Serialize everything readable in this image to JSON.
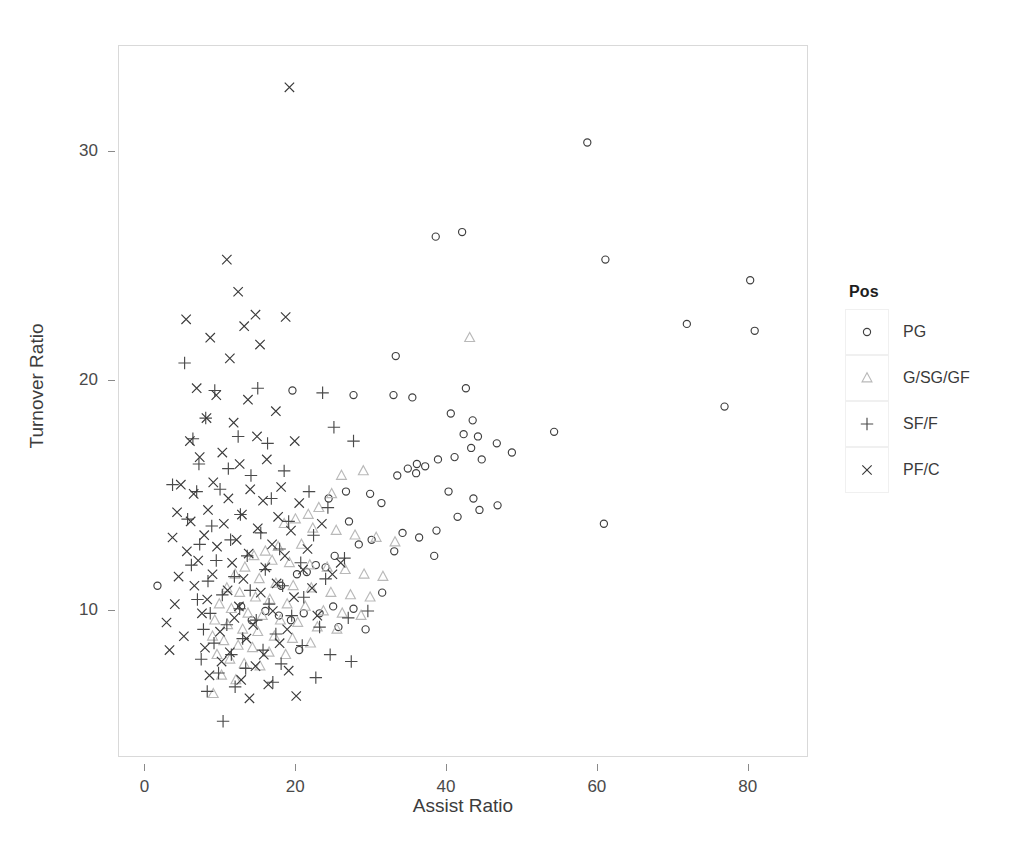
{
  "chart_data": {
    "type": "scatter",
    "title": "",
    "xlabel": "Assist Ratio",
    "ylabel": "Turnover Ratio",
    "xlim": [
      -3.5,
      88.0
    ],
    "ylim": [
      3.6,
      34.6
    ],
    "xticks": [
      0,
      20,
      40,
      60,
      80
    ],
    "xtick_labels": [
      "0",
      "20",
      "40",
      "60",
      "80"
    ],
    "yticks": [
      10,
      20,
      30
    ],
    "ytick_labels": [
      "10",
      "20",
      "30"
    ],
    "grid": false,
    "legend_title": "Pos",
    "legend_position": "right",
    "series": [
      {
        "name": "PG",
        "marker": "circle",
        "color": "#3f3f3f",
        "points": [
          [
            58.6,
            30.4
          ],
          [
            61.0,
            25.3
          ],
          [
            80.2,
            24.4
          ],
          [
            71.8,
            22.5
          ],
          [
            80.8,
            22.2
          ],
          [
            76.8,
            18.9
          ],
          [
            54.2,
            17.8
          ],
          [
            60.8,
            13.8
          ],
          [
            38.5,
            26.3
          ],
          [
            42.0,
            26.5
          ],
          [
            33.2,
            21.1
          ],
          [
            19.5,
            19.6
          ],
          [
            27.6,
            19.4
          ],
          [
            32.9,
            19.4
          ],
          [
            35.4,
            19.3
          ],
          [
            42.5,
            19.7
          ],
          [
            40.5,
            18.6
          ],
          [
            43.4,
            18.3
          ],
          [
            42.2,
            17.7
          ],
          [
            44.1,
            17.6
          ],
          [
            43.2,
            17.1
          ],
          [
            46.6,
            17.3
          ],
          [
            48.6,
            16.9
          ],
          [
            41.0,
            16.7
          ],
          [
            44.6,
            16.6
          ],
          [
            38.8,
            16.6
          ],
          [
            36.0,
            16.4
          ],
          [
            37.1,
            16.3
          ],
          [
            34.8,
            16.2
          ],
          [
            35.9,
            16.0
          ],
          [
            33.4,
            15.9
          ],
          [
            40.2,
            15.2
          ],
          [
            43.5,
            14.9
          ],
          [
            46.7,
            14.6
          ],
          [
            44.3,
            14.4
          ],
          [
            41.4,
            14.1
          ],
          [
            38.6,
            13.5
          ],
          [
            36.3,
            13.2
          ],
          [
            34.1,
            13.4
          ],
          [
            33.0,
            12.6
          ],
          [
            38.3,
            12.4
          ],
          [
            31.3,
            14.7
          ],
          [
            29.8,
            15.1
          ],
          [
            26.6,
            15.2
          ],
          [
            24.3,
            14.9
          ],
          [
            27.0,
            13.9
          ],
          [
            30.0,
            13.1
          ],
          [
            28.3,
            12.9
          ],
          [
            25.1,
            12.4
          ],
          [
            22.6,
            12.0
          ],
          [
            23.9,
            11.9
          ],
          [
            21.4,
            11.7
          ],
          [
            31.4,
            10.8
          ],
          [
            20.1,
            11.6
          ],
          [
            18.0,
            11.1
          ],
          [
            1.6,
            11.1
          ],
          [
            15.9,
            10.0
          ],
          [
            17.7,
            9.8
          ],
          [
            19.3,
            9.6
          ],
          [
            21.0,
            9.9
          ],
          [
            24.9,
            10.2
          ],
          [
            23.1,
            9.9
          ],
          [
            20.4,
            8.3
          ],
          [
            25.6,
            9.3
          ],
          [
            27.6,
            10.1
          ],
          [
            29.2,
            9.2
          ],
          [
            12.7,
            10.2
          ],
          [
            14.1,
            9.6
          ]
        ]
      },
      {
        "name": "G/SG/GF",
        "marker": "triangle",
        "color": "#b9b9b9",
        "points": [
          [
            43.0,
            21.9
          ],
          [
            28.9,
            16.1
          ],
          [
            26.0,
            15.9
          ],
          [
            24.7,
            15.1
          ],
          [
            23.0,
            14.5
          ],
          [
            21.6,
            14.2
          ],
          [
            19.9,
            14.0
          ],
          [
            18.4,
            13.8
          ],
          [
            22.2,
            13.6
          ],
          [
            25.3,
            13.5
          ],
          [
            27.8,
            13.3
          ],
          [
            30.6,
            13.2
          ],
          [
            33.1,
            13.0
          ],
          [
            20.7,
            12.9
          ],
          [
            17.6,
            12.8
          ],
          [
            15.9,
            12.6
          ],
          [
            14.4,
            12.4
          ],
          [
            16.8,
            12.2
          ],
          [
            19.1,
            12.1
          ],
          [
            21.8,
            12.0
          ],
          [
            24.1,
            11.9
          ],
          [
            26.5,
            11.8
          ],
          [
            29.0,
            11.6
          ],
          [
            31.5,
            11.5
          ],
          [
            13.2,
            11.9
          ],
          [
            11.9,
            11.6
          ],
          [
            15.1,
            11.4
          ],
          [
            17.3,
            11.2
          ],
          [
            19.6,
            11.1
          ],
          [
            22.0,
            11.0
          ],
          [
            24.6,
            10.8
          ],
          [
            27.2,
            10.7
          ],
          [
            29.8,
            10.6
          ],
          [
            10.8,
            11.0
          ],
          [
            12.5,
            10.8
          ],
          [
            14.6,
            10.6
          ],
          [
            16.5,
            10.5
          ],
          [
            18.8,
            10.3
          ],
          [
            21.2,
            10.2
          ],
          [
            23.6,
            10.0
          ],
          [
            26.1,
            9.9
          ],
          [
            28.6,
            9.8
          ],
          [
            9.8,
            10.3
          ],
          [
            11.4,
            10.1
          ],
          [
            13.6,
            9.9
          ],
          [
            15.5,
            9.8
          ],
          [
            17.9,
            9.6
          ],
          [
            20.2,
            9.5
          ],
          [
            22.8,
            9.3
          ],
          [
            25.4,
            9.2
          ],
          [
            9.2,
            9.6
          ],
          [
            10.9,
            9.4
          ],
          [
            12.9,
            9.2
          ],
          [
            14.9,
            9.1
          ],
          [
            17.1,
            8.9
          ],
          [
            19.5,
            8.8
          ],
          [
            21.9,
            8.6
          ],
          [
            8.9,
            8.9
          ],
          [
            10.4,
            8.7
          ],
          [
            12.3,
            8.5
          ],
          [
            14.2,
            8.4
          ],
          [
            16.4,
            8.2
          ],
          [
            18.6,
            8.1
          ],
          [
            9.5,
            8.1
          ],
          [
            11.2,
            7.9
          ],
          [
            13.1,
            7.7
          ],
          [
            15.2,
            7.6
          ],
          [
            10.1,
            7.2
          ],
          [
            12.0,
            7.0
          ],
          [
            9.0,
            6.4
          ]
        ]
      },
      {
        "name": "SF/F",
        "marker": "plus",
        "color": "#4a4a4a",
        "points": [
          [
            5.2,
            20.8
          ],
          [
            14.9,
            19.7
          ],
          [
            9.2,
            19.6
          ],
          [
            23.5,
            19.5
          ],
          [
            8.0,
            18.4
          ],
          [
            25.0,
            18.0
          ],
          [
            12.3,
            17.6
          ],
          [
            6.3,
            17.5
          ],
          [
            16.2,
            17.3
          ],
          [
            27.6,
            17.4
          ],
          [
            7.1,
            16.4
          ],
          [
            11.0,
            16.2
          ],
          [
            18.4,
            16.1
          ],
          [
            14.0,
            15.9
          ],
          [
            3.6,
            15.5
          ],
          [
            9.9,
            15.3
          ],
          [
            21.7,
            15.2
          ],
          [
            6.8,
            15.2
          ],
          [
            16.7,
            14.9
          ],
          [
            24.2,
            14.5
          ],
          [
            12.6,
            14.2
          ],
          [
            5.6,
            14.0
          ],
          [
            19.0,
            13.9
          ],
          [
            8.8,
            13.7
          ],
          [
            15.3,
            13.4
          ],
          [
            22.3,
            13.3
          ],
          [
            11.3,
            13.1
          ],
          [
            7.2,
            12.9
          ],
          [
            17.8,
            12.7
          ],
          [
            26.4,
            12.3
          ],
          [
            13.5,
            12.4
          ],
          [
            9.4,
            12.2
          ],
          [
            20.6,
            12.1
          ],
          [
            6.1,
            12.0
          ],
          [
            15.9,
            11.8
          ],
          [
            11.8,
            11.5
          ],
          [
            23.9,
            11.4
          ],
          [
            8.3,
            11.3
          ],
          [
            18.2,
            11.1
          ],
          [
            13.9,
            10.9
          ],
          [
            10.2,
            10.7
          ],
          [
            21.0,
            10.6
          ],
          [
            6.9,
            10.5
          ],
          [
            16.4,
            10.3
          ],
          [
            12.5,
            10.1
          ],
          [
            8.6,
            9.9
          ],
          [
            19.4,
            9.8
          ],
          [
            14.7,
            9.6
          ],
          [
            10.8,
            9.4
          ],
          [
            23.1,
            9.3
          ],
          [
            7.7,
            9.2
          ],
          [
            17.3,
            9.0
          ],
          [
            12.9,
            8.8
          ],
          [
            9.1,
            8.6
          ],
          [
            20.8,
            8.5
          ],
          [
            15.6,
            8.3
          ],
          [
            11.4,
            8.1
          ],
          [
            7.4,
            7.9
          ],
          [
            18.0,
            7.7
          ],
          [
            13.3,
            7.5
          ],
          [
            9.7,
            7.3
          ],
          [
            22.6,
            7.1
          ],
          [
            16.9,
            6.9
          ],
          [
            11.9,
            6.7
          ],
          [
            8.2,
            6.5
          ],
          [
            26.9,
            9.7
          ],
          [
            29.5,
            10.0
          ],
          [
            24.5,
            8.1
          ],
          [
            27.3,
            7.8
          ],
          [
            10.3,
            5.2
          ]
        ]
      },
      {
        "name": "PF/C",
        "marker": "cross",
        "color": "#3a3a3a",
        "points": [
          [
            19.1,
            32.8
          ],
          [
            10.8,
            25.3
          ],
          [
            12.3,
            23.9
          ],
          [
            14.6,
            22.9
          ],
          [
            18.6,
            22.8
          ],
          [
            5.4,
            22.7
          ],
          [
            8.6,
            21.9
          ],
          [
            13.1,
            22.4
          ],
          [
            11.2,
            21.0
          ],
          [
            15.2,
            21.6
          ],
          [
            6.8,
            19.7
          ],
          [
            9.4,
            19.4
          ],
          [
            13.6,
            19.2
          ],
          [
            17.3,
            18.7
          ],
          [
            8.1,
            18.4
          ],
          [
            11.7,
            18.2
          ],
          [
            5.9,
            17.4
          ],
          [
            14.8,
            17.6
          ],
          [
            19.8,
            17.4
          ],
          [
            10.2,
            16.9
          ],
          [
            7.2,
            16.7
          ],
          [
            16.1,
            16.6
          ],
          [
            12.5,
            16.4
          ],
          [
            4.7,
            15.5
          ],
          [
            9.0,
            15.6
          ],
          [
            18.0,
            15.4
          ],
          [
            13.9,
            15.3
          ],
          [
            6.4,
            15.1
          ],
          [
            11.0,
            14.9
          ],
          [
            15.6,
            14.8
          ],
          [
            20.4,
            14.7
          ],
          [
            8.3,
            14.4
          ],
          [
            4.2,
            14.3
          ],
          [
            12.8,
            14.2
          ],
          [
            17.6,
            14.1
          ],
          [
            6.0,
            13.9
          ],
          [
            10.4,
            13.8
          ],
          [
            14.9,
            13.6
          ],
          [
            19.3,
            13.5
          ],
          [
            7.8,
            13.3
          ],
          [
            3.6,
            13.2
          ],
          [
            12.1,
            13.1
          ],
          [
            16.8,
            12.9
          ],
          [
            9.5,
            12.8
          ],
          [
            5.5,
            12.6
          ],
          [
            13.7,
            12.5
          ],
          [
            18.5,
            12.4
          ],
          [
            7.0,
            12.2
          ],
          [
            11.5,
            12.1
          ],
          [
            15.9,
            11.9
          ],
          [
            20.9,
            11.8
          ],
          [
            8.9,
            11.6
          ],
          [
            4.4,
            11.5
          ],
          [
            13.0,
            11.4
          ],
          [
            17.4,
            11.2
          ],
          [
            6.5,
            11.1
          ],
          [
            10.9,
            10.9
          ],
          [
            15.3,
            10.8
          ],
          [
            19.7,
            10.6
          ],
          [
            8.2,
            10.5
          ],
          [
            3.9,
            10.3
          ],
          [
            12.4,
            10.2
          ],
          [
            16.9,
            10.0
          ],
          [
            7.5,
            9.9
          ],
          [
            11.8,
            9.7
          ],
          [
            2.8,
            9.5
          ],
          [
            14.3,
            9.4
          ],
          [
            18.8,
            9.2
          ],
          [
            9.9,
            9.1
          ],
          [
            5.1,
            8.9
          ],
          [
            13.4,
            8.8
          ],
          [
            17.8,
            8.6
          ],
          [
            7.9,
            8.4
          ],
          [
            11.2,
            8.2
          ],
          [
            15.7,
            8.1
          ],
          [
            3.2,
            8.3
          ],
          [
            10.1,
            7.8
          ],
          [
            14.6,
            7.6
          ],
          [
            19.0,
            7.4
          ],
          [
            8.5,
            7.2
          ],
          [
            12.7,
            7.0
          ],
          [
            16.3,
            6.8
          ],
          [
            22.1,
            11.0
          ],
          [
            24.8,
            11.6
          ],
          [
            21.5,
            12.7
          ],
          [
            23.4,
            13.8
          ],
          [
            25.9,
            12.1
          ],
          [
            22.8,
            9.8
          ],
          [
            20.0,
            6.3
          ],
          [
            13.8,
            6.2
          ]
        ]
      }
    ]
  }
}
